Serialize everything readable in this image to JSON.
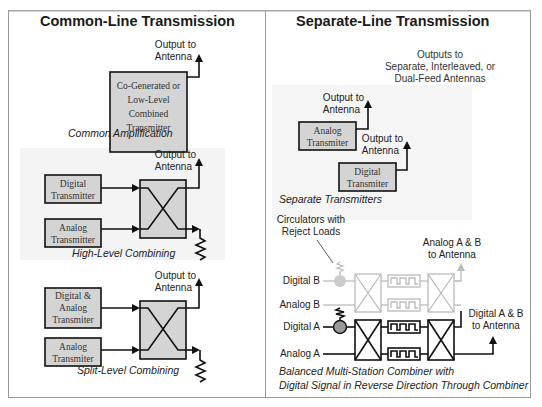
{
  "sections": {
    "common": {
      "title": "Common-Line Transmission",
      "amplification": {
        "box_lines": [
          "Co-Generated or",
          "Low-Level",
          "Combined",
          "Transmitter"
        ],
        "output_lines": [
          "Output to",
          "Antenna"
        ],
        "caption": "Common Amplification"
      },
      "high_level": {
        "box1_lines": [
          "Digital",
          "Transmitter"
        ],
        "box2_lines": [
          "Analog",
          "Transmitter"
        ],
        "output_lines": [
          "Output to",
          "Antenna"
        ],
        "caption": "High-Level Combining"
      },
      "split_level": {
        "box1_lines": [
          "Digital &",
          "Analog",
          "Transmiter"
        ],
        "box2_lines": [
          "Analog",
          "Transmiter"
        ],
        "output_lines": [
          "Output to",
          "Antenna"
        ],
        "caption": "Split-Level Combining"
      }
    },
    "separate": {
      "title": "Separate-Line Transmission",
      "outputs_note": [
        "Outputs to",
        "Separate, Interleaved, or",
        "Dual-Feed Antennas"
      ],
      "transmitters": {
        "box1_lines": [
          "Analog",
          "Transmiter"
        ],
        "box2_lines": [
          "Digital",
          "Transmiter"
        ],
        "output1_lines": [
          "Output to",
          "Antenna"
        ],
        "output2_lines": [
          "Output to",
          "Antenna"
        ],
        "caption": "Separate Transmitters"
      },
      "balanced": {
        "circulator_note": [
          "Circulators with",
          "Reject Loads"
        ],
        "inputs": [
          "Digital B",
          "Analog B",
          "Digital A",
          "Analog A"
        ],
        "analog_out": [
          "Analog A & B",
          "to Antenna"
        ],
        "digital_out": [
          "Digital A & B",
          "to Antenna"
        ],
        "caption": [
          "Balanced Multi-Station Combiner with",
          "Digital Signal in Reverse Direction Through Combiner"
        ]
      }
    }
  },
  "colors": {
    "box_fill": "#d4d4d4",
    "panel_fill": "#f4f4f4",
    "ghost": "#bbbbbb",
    "circulator": "#9a9a9a"
  }
}
